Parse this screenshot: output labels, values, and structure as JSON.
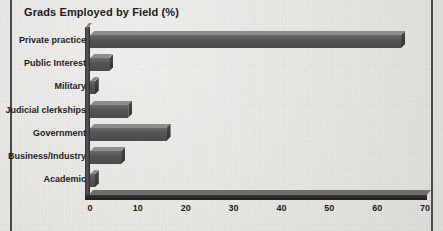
{
  "chart_data": {
    "type": "bar",
    "orientation": "horizontal",
    "title": "Grads Employed by Field (%)",
    "xlabel": "",
    "ylabel": "",
    "categories": [
      "Private practice",
      "Public Interest",
      "Military",
      "Judicial clerkships",
      "Government",
      "Business/Industry",
      "Academic"
    ],
    "values": [
      65,
      4,
      1,
      8,
      16,
      6.5,
      1
    ],
    "xlim": [
      0,
      70
    ],
    "xticks": [
      0,
      10,
      20,
      30,
      40,
      50,
      60,
      70
    ],
    "xtick_labels": [
      "0",
      "10",
      "20",
      "30",
      "40",
      "50",
      "60",
      "70"
    ],
    "grid": false,
    "legend": false,
    "style": "3d-bars-grayscale",
    "colors": {
      "bar_front": "#555555",
      "bar_top": "#8d8d8d",
      "bar_side": "#2f2f2f",
      "axis": "#2a2a2a",
      "text": "#1d1d1d",
      "background": "#e6e5e2",
      "rule": "#4a4a4a"
    }
  }
}
